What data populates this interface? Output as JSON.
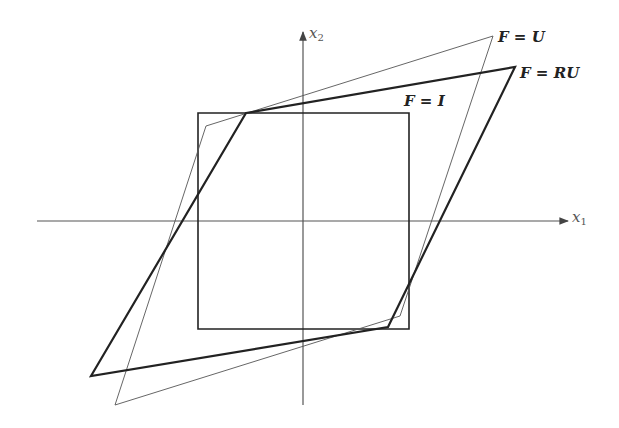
{
  "diagram": {
    "axes": {
      "x1_label": "x",
      "x1_sub": "1",
      "x2_label": "x",
      "x2_sub": "2",
      "color": "#555555"
    },
    "shapes": [
      {
        "name": "F = I",
        "style": "medium",
        "color": "#222222",
        "points": "198,113 409,113 409,329 198,329"
      },
      {
        "name": "F = U",
        "style": "thin",
        "color": "#555555",
        "points": "206,126 493,36 400,316 115,405"
      },
      {
        "name": "F = RU",
        "style": "thick",
        "color": "#222222",
        "points": "246,113 515,67 388,327 91,376"
      }
    ],
    "labels": {
      "identity": "F = I",
      "stretch": "F = U",
      "rotation_stretch": "F = RU"
    }
  }
}
